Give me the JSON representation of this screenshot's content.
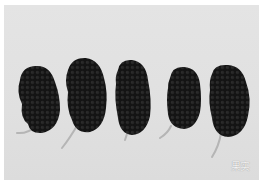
{
  "photo": {
    "subject": "five mulberry fruits on light grey background",
    "background_color": "#e2e2e2",
    "fruit_color": "#151515",
    "stem_color": "#b8b8b8",
    "fruit_count": 5
  },
  "caption": {
    "text": "果实"
  }
}
